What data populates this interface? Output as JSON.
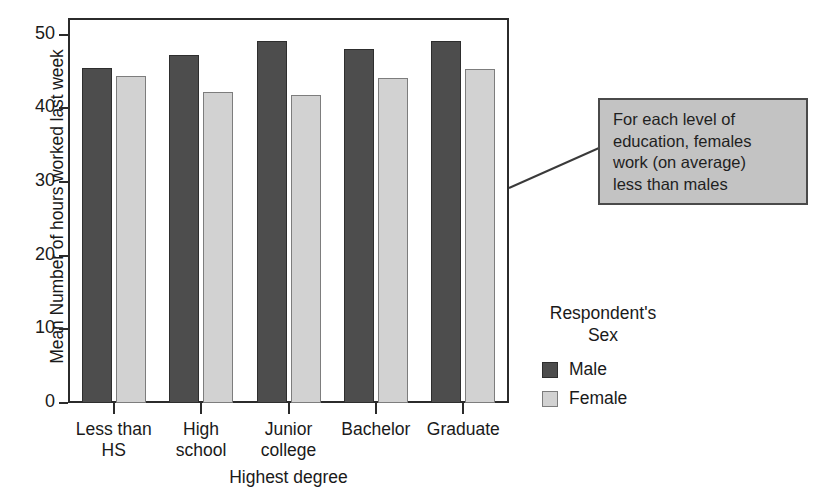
{
  "chart_data": {
    "type": "bar",
    "title": "",
    "xlabel": "Highest degree",
    "ylabel": "Mean Number of hours worked last week",
    "categories": [
      "Less than HS",
      "High school",
      "Junior college",
      "Bachelor",
      "Graduate"
    ],
    "category_lines": [
      [
        "Less than",
        "HS"
      ],
      [
        "High",
        "school"
      ],
      [
        "Junior",
        "college"
      ],
      [
        "Bachelor"
      ],
      [
        "Graduate"
      ]
    ],
    "series": [
      {
        "name": "Male",
        "values": [
          45.5,
          47.3,
          49.2,
          48.0,
          49.1
        ],
        "color": "#4d4d4d"
      },
      {
        "name": "Female",
        "values": [
          44.4,
          42.2,
          41.8,
          44.1,
          45.4
        ],
        "color": "#d2d2d2"
      }
    ],
    "ylim": [
      0,
      52
    ],
    "yticks": [
      0,
      10,
      20,
      30,
      40,
      50
    ],
    "ytick_labels": [
      "0",
      "10",
      "20",
      "30",
      "40",
      "50"
    ],
    "grid": false,
    "legend_position": "right"
  },
  "legend": {
    "title_lines": [
      "Respondent's",
      "Sex"
    ],
    "entries": [
      {
        "label": "Male",
        "swatch": "male"
      },
      {
        "label": "Female",
        "swatch": "female"
      }
    ]
  },
  "annotation": {
    "lines": [
      "For each level of",
      "education, females",
      "work (on average)",
      "less than males"
    ],
    "text": "For each level of education, females work (on average) less than males",
    "fill_color": "#c3c3c3",
    "border_color": "#4a4a4a"
  },
  "colors": {
    "male": "#4d4d4d",
    "female": "#d2d2d2",
    "axis": "#2b2b2b",
    "background": "#ffffff"
  }
}
